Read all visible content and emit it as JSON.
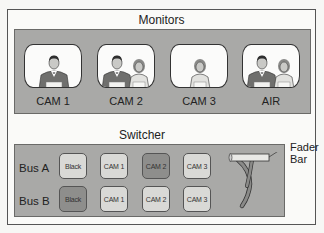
{
  "monitors": {
    "title": "Monitors",
    "items": [
      {
        "label": "CAM 1",
        "people": [
          "man"
        ]
      },
      {
        "label": "CAM 2",
        "people": [
          "man",
          "woman"
        ]
      },
      {
        "label": "CAM 3",
        "people": [
          "woman"
        ]
      },
      {
        "label": "AIR",
        "people": [
          "man",
          "woman"
        ]
      }
    ]
  },
  "switcher": {
    "title": "Switcher",
    "buses": [
      {
        "label": "Bus A",
        "buttons": [
          {
            "label": "Black",
            "active": false
          },
          {
            "label": "CAM 1",
            "active": false
          },
          {
            "label": "CAM 2",
            "active": true
          },
          {
            "label": "CAM 3",
            "active": false
          }
        ]
      },
      {
        "label": "Bus B",
        "buttons": [
          {
            "label": "Black",
            "active": true
          },
          {
            "label": "CAM 1",
            "active": false
          },
          {
            "label": "CAM 2",
            "active": false
          },
          {
            "label": "CAM 3",
            "active": false
          }
        ]
      }
    ],
    "fader": {
      "label_line1": "Fader",
      "label_line2": "Bar"
    }
  },
  "colors": {
    "panel": "#a9a9a7",
    "button": "#d9d9d6",
    "button_active": "#8e8e8c",
    "suit": "#6f6f6d"
  }
}
